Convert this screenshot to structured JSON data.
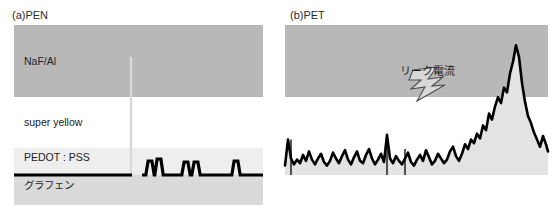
{
  "figure": {
    "background_color": "#ffffff",
    "panels": [
      {
        "id": "panel-a",
        "label": "(a)PEN",
        "layers": [
          {
            "name": "NaF/Al",
            "color": "#b8b8b8"
          },
          {
            "name": "super yellow",
            "color": "#ffffff"
          },
          {
            "name": "PEDOT : PSS",
            "color": "#eeeeee"
          },
          {
            "name": "グラフェン",
            "color": "#dadada"
          }
        ]
      },
      {
        "id": "panel-b",
        "label": "(b)PET",
        "annotation": {
          "text": "リーク電流",
          "icon": "lightning-bolt-icon",
          "icon_fill": "#d8d8d8",
          "icon_stroke": "#555555"
        },
        "layers": [
          {
            "name": "top band",
            "color": "#b8b8b8"
          },
          {
            "name": "lower band",
            "color": "#ffffff"
          }
        ]
      }
    ]
  },
  "chart_data": [
    {
      "type": "line",
      "title": "(a)PEN",
      "xlabel": "",
      "ylabel": "",
      "grid": false,
      "legend": "none",
      "baseline": 0,
      "ylim": [
        0,
        125
      ],
      "xlim": [
        0,
        249
      ],
      "line_color": "#000000",
      "line_width": 3.2,
      "annotations": [
        "NaF/Al",
        "super yellow",
        "PEDOT : PSS",
        "グラフェン"
      ],
      "spike": {
        "x": 117,
        "height": 118,
        "color": "#d9d9d9",
        "width": 2.4
      },
      "x": [
        0,
        4,
        8,
        12,
        16,
        20,
        24,
        28,
        32,
        36,
        40,
        44,
        48,
        52,
        56,
        60,
        64,
        68,
        72,
        76,
        80,
        84,
        88,
        92,
        96,
        100,
        104,
        108,
        112,
        116,
        117,
        118,
        122,
        126,
        130,
        134,
        138,
        142,
        146,
        150,
        154,
        158,
        162,
        166,
        170,
        174,
        178,
        182,
        186,
        190,
        194,
        198,
        202,
        206,
        210,
        214,
        218,
        222,
        226,
        230,
        234,
        238,
        242,
        246,
        249
      ],
      "values": [
        0,
        0,
        0,
        0,
        0,
        0,
        0,
        0,
        0,
        0,
        0,
        0,
        0,
        0,
        0,
        0,
        0,
        0,
        0,
        0,
        0,
        0,
        0,
        0,
        0,
        0,
        0,
        0,
        0,
        0,
        0,
        0,
        0,
        0,
        0,
        0,
        0,
        0,
        0,
        0,
        0,
        0,
        0,
        0,
        0,
        0,
        0,
        0,
        0,
        0,
        0,
        0,
        0,
        0,
        0,
        0,
        0,
        0,
        0,
        0,
        0,
        0,
        0,
        0,
        0
      ],
      "bumps": [
        {
          "x": 136,
          "height": 14
        },
        {
          "x": 145,
          "height": 16
        },
        {
          "x": 172,
          "height": 13
        },
        {
          "x": 182,
          "height": 13
        },
        {
          "x": 222,
          "height": 14
        }
      ],
      "gap": {
        "from": 118,
        "to": 128
      }
    },
    {
      "type": "area",
      "title": "(b)PET",
      "xlabel": "",
      "ylabel": "",
      "grid": false,
      "legend": "none",
      "baseline": 0,
      "ylim": [
        0,
        125
      ],
      "xlim": [
        0,
        263
      ],
      "line_color": "#000000",
      "fill_color": "#e3e3e3",
      "line_width": 2.6,
      "annotations": [
        "リーク電流"
      ],
      "x": [
        0,
        3,
        6,
        9,
        12,
        15,
        18,
        21,
        24,
        27,
        30,
        33,
        36,
        39,
        42,
        45,
        48,
        51,
        54,
        57,
        60,
        63,
        66,
        69,
        72,
        75,
        78,
        81,
        84,
        87,
        90,
        93,
        96,
        99,
        102,
        105,
        108,
        111,
        114,
        117,
        120,
        123,
        126,
        129,
        132,
        135,
        138,
        141,
        144,
        147,
        150,
        153,
        156,
        159,
        162,
        165,
        168,
        171,
        174,
        177,
        180,
        183,
        186,
        189,
        192,
        195,
        198,
        201,
        204,
        207,
        210,
        213,
        216,
        219,
        222,
        225,
        228,
        231,
        234,
        237,
        240,
        243,
        246,
        249,
        252,
        255,
        258,
        261,
        263
      ],
      "values": [
        8,
        30,
        14,
        9,
        13,
        10,
        17,
        12,
        20,
        13,
        9,
        14,
        18,
        11,
        8,
        12,
        19,
        14,
        10,
        16,
        21,
        13,
        9,
        15,
        20,
        12,
        10,
        17,
        22,
        14,
        9,
        13,
        18,
        11,
        34,
        14,
        10,
        16,
        12,
        9,
        14,
        19,
        11,
        8,
        13,
        17,
        12,
        21,
        15,
        9,
        12,
        18,
        14,
        10,
        13,
        20,
        24,
        16,
        12,
        18,
        26,
        22,
        30,
        27,
        35,
        31,
        42,
        38,
        52,
        47,
        58,
        66,
        61,
        74,
        70,
        86,
        96,
        110,
        100,
        78,
        62,
        50,
        44,
        36,
        30,
        24,
        33,
        26,
        20
      ],
      "spikes": [
        {
          "x": 6,
          "height": 30
        },
        {
          "x": 102,
          "height": 34
        },
        {
          "x": 120,
          "height": 22
        }
      ],
      "peak": {
        "x": 231,
        "height": 110,
        "label": "リーク電流"
      }
    }
  ]
}
